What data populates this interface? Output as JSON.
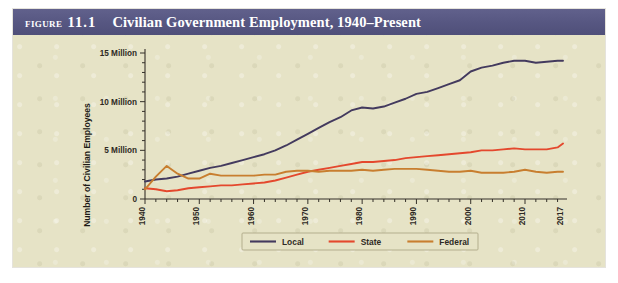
{
  "figure": {
    "label_word": "Figure",
    "number": "11.1",
    "title": "Civilian Government Employment, 1940–Present",
    "band_color": "#585883",
    "panel_color": "#e6e3c6"
  },
  "chart_data": {
    "type": "line",
    "title": "Civilian Government Employment, 1940–Present",
    "xlabel": "Year",
    "ylabel": "Number of Civilian Employees",
    "xlim": [
      1940,
      2017
    ],
    "ylim": [
      0,
      15
    ],
    "y_unit": "Million",
    "grid": false,
    "legend_position": "bottom-center",
    "ytick_values": [
      0,
      5,
      10,
      15
    ],
    "ytick_labels": [
      "0",
      "5 Million",
      "10 Million",
      "15 Million"
    ],
    "yminor_step": 1,
    "xtick_values": [
      1940,
      1950,
      1960,
      1970,
      1980,
      1990,
      2000,
      2010,
      2017
    ],
    "xtick_labels": [
      "1940",
      "1950",
      "1960",
      "1970",
      "1980",
      "1990",
      "2000",
      "2010",
      "2017"
    ],
    "xminor_step": 2,
    "x": [
      1940,
      1942,
      1944,
      1946,
      1948,
      1950,
      1952,
      1954,
      1956,
      1958,
      1960,
      1962,
      1964,
      1966,
      1968,
      1970,
      1972,
      1974,
      1976,
      1978,
      1980,
      1982,
      1984,
      1986,
      1988,
      1990,
      1992,
      1994,
      1996,
      1998,
      2000,
      2002,
      2004,
      2006,
      2008,
      2010,
      2012,
      2014,
      2016,
      2017
    ],
    "series": [
      {
        "name": "Local",
        "color": "#433a5e",
        "values": [
          1.8,
          2.0,
          2.1,
          2.3,
          2.6,
          2.9,
          3.2,
          3.4,
          3.7,
          4.0,
          4.3,
          4.6,
          5.0,
          5.5,
          6.1,
          6.7,
          7.3,
          7.9,
          8.4,
          9.1,
          9.4,
          9.3,
          9.5,
          9.9,
          10.3,
          10.8,
          11.0,
          11.4,
          11.8,
          12.2,
          13.1,
          13.5,
          13.7,
          14.0,
          14.2,
          14.2,
          14.0,
          14.1,
          14.2,
          14.2
        ]
      },
      {
        "name": "State",
        "color": "#e4482d",
        "values": [
          1.1,
          1.0,
          0.8,
          0.9,
          1.1,
          1.2,
          1.3,
          1.4,
          1.4,
          1.5,
          1.6,
          1.7,
          1.9,
          2.2,
          2.5,
          2.8,
          3.0,
          3.2,
          3.4,
          3.6,
          3.8,
          3.8,
          3.9,
          4.0,
          4.2,
          4.3,
          4.4,
          4.5,
          4.6,
          4.7,
          4.8,
          5.0,
          5.0,
          5.1,
          5.2,
          5.1,
          5.1,
          5.1,
          5.3,
          5.7
        ]
      },
      {
        "name": "Federal",
        "color": "#c87e2f",
        "values": [
          1.0,
          2.3,
          3.4,
          2.6,
          2.1,
          2.1,
          2.6,
          2.4,
          2.4,
          2.4,
          2.4,
          2.5,
          2.5,
          2.8,
          2.9,
          2.9,
          2.8,
          2.9,
          2.9,
          2.9,
          3.0,
          2.9,
          3.0,
          3.1,
          3.1,
          3.1,
          3.0,
          2.9,
          2.8,
          2.8,
          2.9,
          2.7,
          2.7,
          2.7,
          2.8,
          3.0,
          2.8,
          2.7,
          2.8,
          2.8
        ]
      }
    ],
    "legend": [
      {
        "label": "Local",
        "color": "#433a5e"
      },
      {
        "label": "State",
        "color": "#e4482d"
      },
      {
        "label": "Federal",
        "color": "#c87e2f"
      }
    ]
  }
}
